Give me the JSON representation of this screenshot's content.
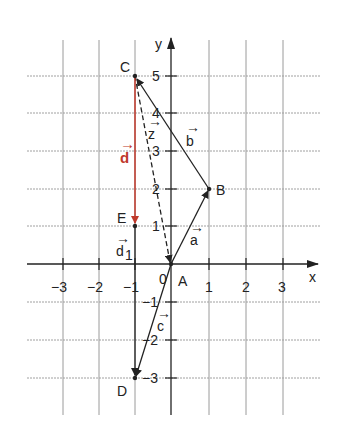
{
  "diagram": {
    "type": "coordinate-plane-vectors",
    "axes": {
      "x_label": "x",
      "y_label": "y",
      "origin_label": "0"
    },
    "x_ticks": [
      "−3",
      "−2",
      "−1",
      "1",
      "2",
      "3"
    ],
    "y_ticks": [
      "5",
      "4",
      "3",
      "2",
      "1",
      "−1",
      "−2",
      "−3"
    ],
    "points": [
      {
        "name": "A",
        "x": 0,
        "y": 0
      },
      {
        "name": "B",
        "x": 1,
        "y": 2
      },
      {
        "name": "C",
        "x": -1,
        "y": 5
      },
      {
        "name": "D",
        "x": -1,
        "y": -3
      },
      {
        "name": "E",
        "x": -1,
        "y": 1
      }
    ],
    "vectors": [
      {
        "name": "a",
        "from": "A",
        "to": "B",
        "style": "solid",
        "color": "#222222"
      },
      {
        "name": "b",
        "from": "B",
        "to": "C",
        "style": "solid",
        "color": "#222222"
      },
      {
        "name": "z",
        "from": "C",
        "to": "A",
        "style": "dashed",
        "color": "#222222"
      },
      {
        "name": "d",
        "from": "C",
        "to": "E",
        "style": "solid",
        "color": "#c0392b"
      },
      {
        "name": "d1",
        "label": "d",
        "subscript": "1",
        "from": "E",
        "to": "D",
        "style": "solid",
        "color": "#222222"
      },
      {
        "name": "c",
        "from": "A",
        "to": "D",
        "style": "solid",
        "color": "#222222"
      }
    ],
    "vector_labels": {
      "a": "a",
      "b": "b",
      "c": "c",
      "z": "z",
      "d": "d",
      "d1_main": "d",
      "d1_sub": "1"
    },
    "arrow_glyph": "→",
    "accent_color": "#c0392b"
  }
}
